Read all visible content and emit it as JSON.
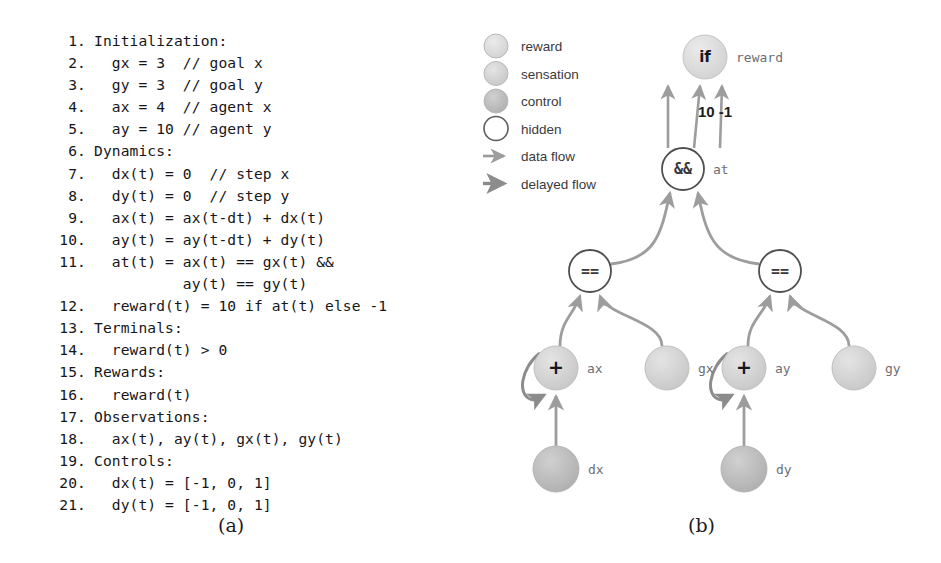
{
  "figure": {
    "captions": {
      "a": "(a)",
      "b": "(b)"
    }
  },
  "panel_a": {
    "name": "pseudo-code-listing",
    "lines": [
      {
        "num": "1.",
        "text": "Initialization:"
      },
      {
        "num": "2.",
        "text": "  gx = 3  // goal x"
      },
      {
        "num": "3.",
        "text": "  gy = 3  // goal y"
      },
      {
        "num": "4.",
        "text": "  ax = 4  // agent x"
      },
      {
        "num": "5.",
        "text": "  ay = 10 // agent y"
      },
      {
        "num": "6.",
        "text": "Dynamics:"
      },
      {
        "num": "7.",
        "text": "  dx(t) = 0  // step x"
      },
      {
        "num": "8.",
        "text": "  dy(t) = 0  // step y"
      },
      {
        "num": "9.",
        "text": "  ax(t) = ax(t-dt) + dx(t)"
      },
      {
        "num": "10.",
        "text": "  ay(t) = ay(t-dt) + dy(t)"
      },
      {
        "num": "11.",
        "text": "  at(t) = ax(t) == gx(t) &&"
      },
      {
        "num": "",
        "text": "          ay(t) == gy(t)"
      },
      {
        "num": "12.",
        "text": "  reward(t) = 10 if at(t) else -1"
      },
      {
        "num": "13.",
        "text": "Terminals:"
      },
      {
        "num": "14.",
        "text": "  reward(t) > 0"
      },
      {
        "num": "15.",
        "text": "Rewards:"
      },
      {
        "num": "16.",
        "text": "  reward(t)"
      },
      {
        "num": "17.",
        "text": "Observations:"
      },
      {
        "num": "18.",
        "text": "  ax(t), ay(t), gx(t), gy(t)"
      },
      {
        "num": "19.",
        "text": "Controls:"
      },
      {
        "num": "20.",
        "text": "  dx(t) = [-1, 0, 1]"
      },
      {
        "num": "21.",
        "text": "  dy(t) = [-1, 0, 1]"
      }
    ]
  },
  "panel_b": {
    "name": "computation-graph",
    "legend": {
      "items": [
        {
          "label": "reward",
          "kind": "node",
          "color": "#dcdcdc"
        },
        {
          "label": "sensation",
          "kind": "node",
          "color": "#d2d2d2"
        },
        {
          "label": "control",
          "kind": "node",
          "color": "#bdbdbd"
        },
        {
          "label": "hidden",
          "kind": "node",
          "color": "#ffffff"
        },
        {
          "label": "data flow",
          "kind": "arrow",
          "color": "#9a9a9a"
        },
        {
          "label": "delayed flow",
          "kind": "arrow",
          "color": "#8a8a8a"
        }
      ]
    },
    "nodes": [
      {
        "id": "if",
        "glyph": "if",
        "label": "reward",
        "type": "reward",
        "x": 235,
        "y": 41,
        "r": 22
      },
      {
        "id": "and",
        "glyph": "&&",
        "label": "at",
        "type": "hidden",
        "x": 213,
        "y": 153,
        "r": 21
      },
      {
        "id": "eq1",
        "glyph": "==",
        "label": "",
        "type": "hidden",
        "x": 120,
        "y": 255,
        "r": 21
      },
      {
        "id": "eq2",
        "glyph": "==",
        "label": "",
        "type": "hidden",
        "x": 310,
        "y": 255,
        "r": 21
      },
      {
        "id": "ax",
        "glyph": "+",
        "label": "ax",
        "type": "sensation",
        "x": 86,
        "y": 352,
        "r": 22
      },
      {
        "id": "gx",
        "glyph": "",
        "label": "gx",
        "type": "sensation",
        "x": 197,
        "y": 352,
        "r": 22
      },
      {
        "id": "ay",
        "glyph": "+",
        "label": "ay",
        "type": "sensation",
        "x": 274,
        "y": 352,
        "r": 22
      },
      {
        "id": "gy",
        "glyph": "",
        "label": "gy",
        "type": "sensation",
        "x": 384,
        "y": 352,
        "r": 22
      },
      {
        "id": "dx",
        "glyph": "",
        "label": "dx",
        "type": "control",
        "x": 86,
        "y": 453,
        "r": 23
      },
      {
        "id": "dy",
        "glyph": "",
        "label": "dy",
        "type": "control",
        "x": 274,
        "y": 453,
        "r": 23
      }
    ],
    "edge_labels": [
      {
        "text": "10 -1",
        "x": 228,
        "y": 101
      }
    ]
  }
}
